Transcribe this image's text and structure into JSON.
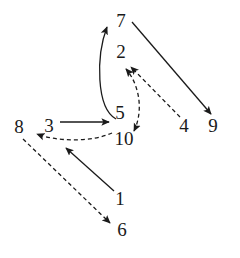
{
  "diagram": {
    "type": "directed-graph",
    "title": "",
    "canvas": {
      "width": 240,
      "height": 258,
      "background": "#ffffff"
    },
    "style": {
      "node_label_color": "#1a1a1a",
      "node_label_font_size": 19,
      "solid_edge_color": "#1a1a1a",
      "dashed_edge_color": "#1a1a1a",
      "edge_width": 1.3,
      "dash_pattern": "4 3"
    },
    "nodes": [
      {
        "id": "7",
        "label": "7",
        "x": 121,
        "y": 20
      },
      {
        "id": "2",
        "label": "2",
        "x": 121,
        "y": 51
      },
      {
        "id": "5",
        "label": "5",
        "x": 120,
        "y": 112
      },
      {
        "id": "8",
        "label": "8",
        "x": 19,
        "y": 126
      },
      {
        "id": "3",
        "label": "3",
        "x": 49,
        "y": 125
      },
      {
        "id": "10",
        "label": "10",
        "x": 124,
        "y": 138
      },
      {
        "id": "4",
        "label": "4",
        "x": 184,
        "y": 125
      },
      {
        "id": "9",
        "label": "9",
        "x": 213,
        "y": 125
      },
      {
        "id": "1",
        "label": "1",
        "x": 120,
        "y": 198
      },
      {
        "id": "6",
        "label": "6",
        "x": 122,
        "y": 229
      }
    ],
    "edges": [
      {
        "id": "e-5-7",
        "from": "5",
        "to": "7",
        "style": "solid",
        "shape": "curved",
        "arrow": "end"
      },
      {
        "id": "e-7-9",
        "from": "7",
        "to": "9",
        "style": "solid",
        "shape": "straight",
        "arrow": "end"
      },
      {
        "id": "e-3-5",
        "from": "3",
        "to": "5",
        "style": "solid",
        "shape": "straight",
        "arrow": "end"
      },
      {
        "id": "e-1-3",
        "from": "1",
        "to": "3",
        "style": "solid",
        "shape": "straight",
        "arrow": "end"
      },
      {
        "id": "e-10-2",
        "from": "10",
        "to": "2",
        "style": "dashed",
        "shape": "curved",
        "arrow": "both"
      },
      {
        "id": "e-4-2",
        "from": "4",
        "to": "2",
        "style": "dashed",
        "shape": "straight",
        "arrow": "end"
      },
      {
        "id": "e-10-8",
        "from": "10",
        "to": "8",
        "style": "dashed",
        "shape": "curved",
        "arrow": "end"
      },
      {
        "id": "e-8-6",
        "from": "8",
        "to": "6",
        "style": "dashed",
        "shape": "straight",
        "arrow": "end"
      }
    ]
  }
}
